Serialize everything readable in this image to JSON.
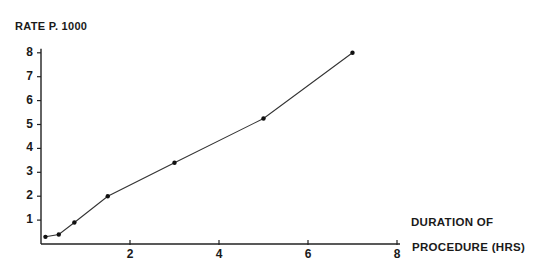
{
  "chart_data": {
    "type": "line",
    "title": "",
    "ylabel": "RATE P. 1000",
    "xlabel": "DURATION OF PROCEDURE (HRS)",
    "xlabel_lines": [
      "DURATION  OF",
      "PROCEDURE (HRS)"
    ],
    "x_ticks": [
      2,
      4,
      6,
      8
    ],
    "y_ticks": [
      1,
      2,
      3,
      4,
      5,
      6,
      7,
      8
    ],
    "xlim": [
      0,
      8
    ],
    "ylim": [
      0,
      8
    ],
    "grid": false,
    "legend": null,
    "series": [
      {
        "name": "rate",
        "x": [
          0.1,
          0.4,
          0.75,
          1.5,
          3.0,
          5.0,
          7.0
        ],
        "y": [
          0.3,
          0.4,
          0.9,
          2.0,
          3.4,
          5.25,
          8.0
        ]
      }
    ],
    "colors": {
      "line": "#333333",
      "axis": "#222222"
    }
  }
}
